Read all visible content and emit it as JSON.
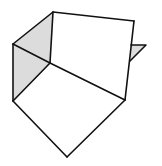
{
  "figure": {
    "colors": {
      "line": "#111111",
      "shade": "#dcdcdc",
      "face": "#ffffff",
      "background": "#ffffff"
    },
    "vertices": {
      "top": [
        53,
        12
      ],
      "top_right": [
        134,
        21
      ],
      "left_upper": [
        13,
        44
      ],
      "center": [
        50,
        63
      ],
      "left_lower": [
        13,
        101
      ],
      "right_lower": [
        125,
        100
      ],
      "bottom": [
        67,
        157
      ],
      "flap_a": [
        131,
        45
      ],
      "flap_tip": [
        146,
        45
      ],
      "flap_b": [
        130,
        61
      ]
    },
    "shaded_faces": [
      {
        "name": "upper-left-shaded-face",
        "points": "53,12 13,44 50,63"
      },
      {
        "name": "lower-left-shaded-face",
        "points": "13,44 50,63 13,101"
      },
      {
        "name": "right-flap-shaded-face",
        "points": "131,45 146,45 130,61"
      }
    ],
    "edges": [
      {
        "name": "edge-top-to-topright",
        "points": "53,12 134,21"
      },
      {
        "name": "edge-topright-to-rightlower",
        "points": "134,21 125,100"
      },
      {
        "name": "edge-top-to-center",
        "points": "53,12 50,63"
      },
      {
        "name": "edge-top-to-leftupper",
        "points": "53,12 13,44"
      },
      {
        "name": "edge-leftupper-to-center",
        "points": "13,44 50,63"
      },
      {
        "name": "edge-center-to-rightlower",
        "points": "50,63 125,100"
      },
      {
        "name": "edge-leftupper-to-leftlower",
        "points": "13,44 13,101"
      },
      {
        "name": "edge-center-to-leftlower",
        "points": "50,63 13,101"
      },
      {
        "name": "edge-leftlower-to-bottom",
        "points": "13,101 67,157"
      },
      {
        "name": "edge-rightlower-to-bottom",
        "points": "125,100 67,157"
      },
      {
        "name": "edge-flap",
        "points": "131,45 146,45 130,61"
      }
    ]
  }
}
